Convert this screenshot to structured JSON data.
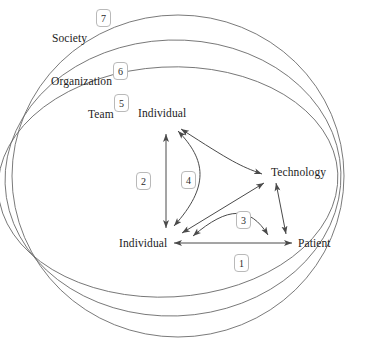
{
  "diagram": {
    "type": "nested-ellipse-system-model",
    "rings": [
      {
        "id": "society",
        "label": "Society",
        "badge": "7",
        "label_x": 52,
        "label_y": 32,
        "badge_x": 96,
        "badge_y": 9,
        "cx": 175,
        "cy": 176,
        "rx": 163,
        "ry": 162
      },
      {
        "id": "organization",
        "label": "Organization",
        "badge": "6",
        "label_x": 51,
        "label_y": 75,
        "badge_x": 113,
        "badge_y": 62,
        "cx": 179,
        "cy": 181,
        "rx": 167,
        "ry": 142
      },
      {
        "id": "team",
        "label": "Team",
        "badge": "5",
        "label_x": 88,
        "label_y": 108,
        "badge_x": 114,
        "badge_y": 94,
        "cx": 183,
        "cy": 184,
        "rx": 170,
        "ry": 121
      }
    ],
    "nodes": [
      {
        "id": "individual-top",
        "label": "Individual",
        "x": 138,
        "y": 107,
        "anchor_x": 165,
        "anchor_y": 131
      },
      {
        "id": "technology",
        "label": "Technology",
        "x": 271,
        "y": 166,
        "anchor_x": 268,
        "anchor_y": 178
      },
      {
        "id": "individual-bottom",
        "label": "Individual",
        "x": 119,
        "y": 237,
        "anchor_x": 168,
        "anchor_y": 232
      },
      {
        "id": "patient",
        "label": "Patient",
        "x": 298,
        "y": 237,
        "anchor_x": 296,
        "anchor_y": 242
      }
    ],
    "relations": [
      {
        "id": "rel-1",
        "badge": "1",
        "badge_x": 234,
        "badge_y": 254,
        "from": "individual-bottom",
        "to": "patient",
        "arrows": "both",
        "style": "straight",
        "description": "Individual to Patient"
      },
      {
        "id": "rel-2",
        "badge": "2",
        "badge_x": 136,
        "badge_y": 172,
        "from": "individual-bottom",
        "to": "individual-top",
        "arrows": "both",
        "style": "straight",
        "description": "Individual to Individual"
      },
      {
        "id": "rel-3",
        "badge": "3",
        "badge_x": 236,
        "badge_y": 211,
        "from": "technology",
        "to": "patient",
        "arrows": "both",
        "style": "curved",
        "description": "Technology to Patient"
      },
      {
        "id": "rel-4",
        "badge": "4",
        "badge_x": 181,
        "badge_y": 171,
        "from": "individual-top",
        "to": "individual-bottom",
        "arrows": "both",
        "style": "curved",
        "description": "Individual to Individual via technology"
      }
    ],
    "colors": {
      "stroke": "#555555",
      "ring_stroke": "#6b6b6b",
      "badge_border": "#b9b9b9",
      "text": "#1c1c1c",
      "background": "#ffffff"
    }
  }
}
